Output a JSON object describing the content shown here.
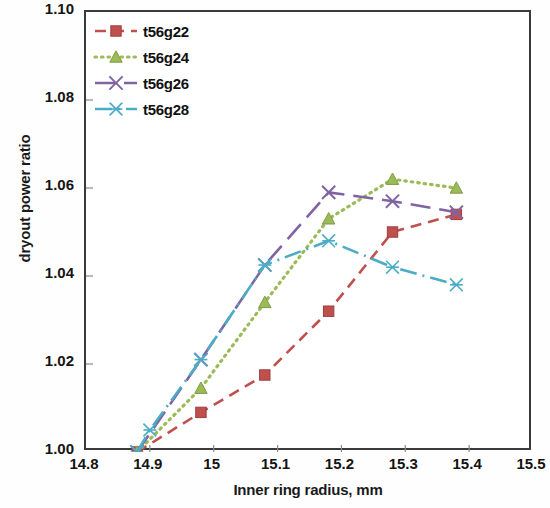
{
  "chart_data": {
    "type": "line",
    "title": "",
    "xlabel": "Inner ring radius, mm",
    "ylabel": "dryout power ratio",
    "xlim": [
      14.8,
      15.5
    ],
    "ylim": [
      1.0,
      1.1
    ],
    "xticks": [
      "14.8",
      "14.9",
      "15",
      "15.1",
      "15.2",
      "15.3",
      "15.4",
      "15.5"
    ],
    "xtick_values": [
      14.8,
      14.9,
      15.0,
      15.1,
      15.2,
      15.3,
      15.4,
      15.5
    ],
    "yticks": [
      "1.00",
      "1.02",
      "1.04",
      "1.06",
      "1.08",
      "1.10"
    ],
    "ytick_values": [
      1.0,
      1.02,
      1.04,
      1.06,
      1.08,
      1.1
    ],
    "grid": false,
    "legend_position": "top-left",
    "series": [
      {
        "name": "t56g22",
        "color": "#C0504D",
        "marker": "square",
        "dash": "dashed",
        "x": [
          14.88,
          14.98,
          15.08,
          15.18,
          15.28,
          15.38
        ],
        "y": [
          1.0,
          1.009,
          1.0175,
          1.032,
          1.05,
          1.054
        ]
      },
      {
        "name": "t56g24",
        "color": "#9BBB59",
        "marker": "triangle",
        "dash": "dotted",
        "x": [
          14.88,
          14.98,
          15.08,
          15.18,
          15.28,
          15.38
        ],
        "y": [
          1.0,
          1.0145,
          1.034,
          1.053,
          1.062,
          1.06
        ]
      },
      {
        "name": "t56g26",
        "color": "#8064A2",
        "marker": "cross",
        "dash": "long-dash",
        "x": [
          14.88,
          14.98,
          15.08,
          15.18,
          15.28,
          15.38
        ],
        "y": [
          1.0,
          1.021,
          1.0425,
          1.059,
          1.057,
          1.0545
        ]
      },
      {
        "name": "t56g28",
        "color": "#4BACC6",
        "marker": "asterisk",
        "dash": "dash-dot",
        "x": [
          14.88,
          14.9,
          14.98,
          15.08,
          15.18,
          15.28,
          15.38
        ],
        "y": [
          1.0,
          1.005,
          1.021,
          1.0425,
          1.048,
          1.042,
          1.038
        ]
      }
    ]
  },
  "legend": {
    "items": [
      {
        "label": "t56g22"
      },
      {
        "label": "t56g24"
      },
      {
        "label": "t56g26"
      },
      {
        "label": "t56g28"
      }
    ]
  }
}
